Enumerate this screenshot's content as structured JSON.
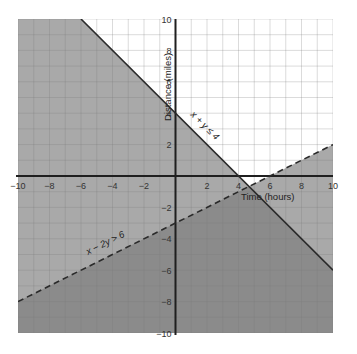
{
  "chart_data": {
    "type": "line",
    "title": "",
    "xlabel": "Time (hours)",
    "ylabel": "Distance (miles)",
    "xlim": [
      -10,
      10
    ],
    "ylim": [
      -10,
      10
    ],
    "grid": true,
    "grid_step": 1,
    "x_ticks": [
      -10,
      -8,
      -6,
      -4,
      -2,
      2,
      4,
      6,
      8,
      10
    ],
    "y_ticks": [
      10,
      8,
      6,
      4,
      2,
      -2,
      -4,
      -6,
      -8,
      -10
    ],
    "x_tick_labels": [
      "−10",
      "−8",
      "−6",
      "−4",
      "−2",
      "2",
      "4",
      "6",
      "8",
      "10"
    ],
    "y_tick_labels": [
      "10",
      "8",
      "6",
      "4",
      "2",
      "−2",
      "−4",
      "−6",
      "−8",
      "−10"
    ],
    "series": [
      {
        "name": "x + y ≤ 4",
        "style": "solid",
        "points": [
          [
            -6,
            10
          ],
          [
            10,
            -6
          ]
        ],
        "shaded_side": "below",
        "label": "x + y ≤ 4",
        "label_position": [
          2,
          2.5
        ]
      },
      {
        "name": "x − 2y > 6",
        "style": "dashed",
        "points": [
          [
            -10,
            -8
          ],
          [
            10,
            2
          ]
        ],
        "shaded_side": "below",
        "label": "x − 2y > 6",
        "label_position": [
          -6,
          -4.5
        ]
      }
    ],
    "regions": [
      {
        "name": "unshaded",
        "description": "x + y > 4 and x − 2y < 6",
        "color": "#ffffff"
      },
      {
        "name": "single-shaded",
        "description": "only one inequality satisfied",
        "color": "#a8a8a8"
      },
      {
        "name": "double-shaded",
        "description": "x + y ≤ 4 and x − 2y > 6",
        "color": "#8a8a8a"
      }
    ],
    "annotations": [
      "x + y ≤ 4",
      "x − 2y > 6"
    ]
  },
  "labels": {
    "xlabel": "Time (hours)",
    "ylabel": "Distance (miles)",
    "line1": "x + y ≤ 4",
    "line2": "x − 2y > 6"
  },
  "colors": {
    "background": "#ffffff",
    "shade_light": "#a9a9a9",
    "shade_dark": "#8b8b8b",
    "grid_on_white": "#cfcfcf",
    "grid_on_shade": "#9a9a9a",
    "axis": "#1f1f1f",
    "boundary": "#2a2a2a"
  }
}
